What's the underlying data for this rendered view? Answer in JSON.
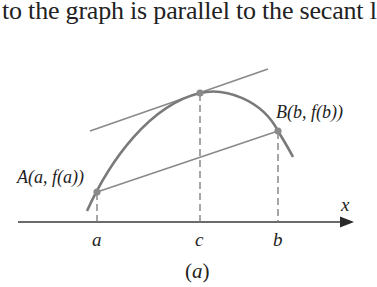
{
  "header": {
    "text": "to the graph is parallel to the secant l"
  },
  "figure": {
    "caption_open": "(",
    "caption_letter": "a",
    "caption_close": ")",
    "x_axis_label": "x",
    "ticks": [
      {
        "label": "a",
        "x": 97
      },
      {
        "label": "c",
        "x": 200
      },
      {
        "label": "b",
        "x": 278
      }
    ],
    "points": {
      "A": {
        "label": "A(a, f(a))",
        "x": 97,
        "y": 192
      },
      "C": {
        "label": "",
        "x": 200,
        "y": 93
      },
      "B": {
        "label": "B(b, f(b))",
        "x": 278,
        "y": 131
      }
    },
    "lines": {
      "tangent": {
        "x1": 90,
        "y1": 131,
        "x2": 268,
        "y2": 69
      },
      "secant": {
        "x1": 97,
        "y1": 192,
        "x2": 278,
        "y2": 131
      }
    },
    "colors": {
      "curve": "#7a7a7a",
      "lines": "#8a8a8a",
      "axis": "#3a3a3a",
      "text": "#222222"
    }
  }
}
